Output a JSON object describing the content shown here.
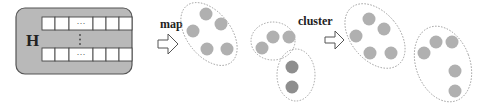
{
  "matrix": {
    "label": "H",
    "cell_ellipsis": "···",
    "row_ellipsis": "⋮"
  },
  "steps": [
    {
      "label": "map"
    },
    {
      "label": "cluster"
    }
  ],
  "colors": {
    "box_fill": "#b9b9b9",
    "box_stroke": "#555555",
    "point": "#b0b0b0",
    "point_dark": "#8e8e8e",
    "ellipse_stroke": "#9a9a9a"
  },
  "mapped_groups": [
    {
      "points": 5,
      "shade": "light"
    },
    {
      "points": 3,
      "shade": "light"
    },
    {
      "points": 2,
      "shade": "dark"
    }
  ],
  "clustered_groups": [
    {
      "points": 5
    },
    {
      "points": 5
    }
  ]
}
